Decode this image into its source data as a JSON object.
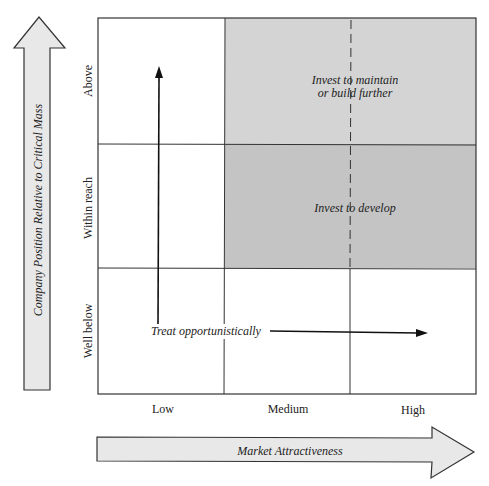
{
  "diagram": {
    "type": "strategy-matrix-3x3",
    "y_axis": {
      "title": "Company Position Relative to Critical Mass",
      "levels": [
        "Well below",
        "Within reach",
        "Above"
      ]
    },
    "x_axis": {
      "title": "Market Attractiveness",
      "levels": [
        "Low",
        "Medium",
        "High"
      ]
    },
    "regions": {
      "maintain": "Invest to maintain\nor build further",
      "maintain_line1": "Invest to maintain",
      "maintain_line2": "or build further",
      "develop": "Invest to develop",
      "opportunistic": "Treat opportunistically"
    },
    "colors": {
      "shade_above": "#d4d4d4",
      "shade_within": "#c4c4c4",
      "arrow_fill": "#e8e8e8",
      "lines": "#333333"
    }
  }
}
